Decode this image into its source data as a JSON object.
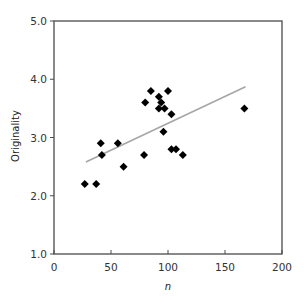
{
  "chart_data": {
    "type": "scatter",
    "title": "",
    "xlabel": "n",
    "ylabel": "Originality",
    "xlim": [
      0,
      200
    ],
    "ylim": [
      1.0,
      5.0
    ],
    "xticks": [
      0,
      50,
      100,
      150,
      200
    ],
    "xtick_labels": [
      "0",
      "50",
      "100",
      "150",
      "200"
    ],
    "yticks": [
      1.0,
      2.0,
      3.0,
      4.0,
      5.0
    ],
    "ytick_labels": [
      "1.0",
      "2.0",
      "3.0",
      "4.0",
      "5.0"
    ],
    "grid": false,
    "legend": null,
    "marker": "diamond",
    "marker_color": "#000000",
    "series": [
      {
        "name": "observations",
        "points": [
          {
            "x": 27,
            "y": 2.2
          },
          {
            "x": 37,
            "y": 2.2
          },
          {
            "x": 41,
            "y": 2.9
          },
          {
            "x": 42,
            "y": 2.7
          },
          {
            "x": 56,
            "y": 2.9
          },
          {
            "x": 61,
            "y": 2.5
          },
          {
            "x": 79,
            "y": 2.7
          },
          {
            "x": 80,
            "y": 3.6
          },
          {
            "x": 85,
            "y": 3.8
          },
          {
            "x": 92,
            "y": 3.7
          },
          {
            "x": 92,
            "y": 3.5
          },
          {
            "x": 94,
            "y": 3.6
          },
          {
            "x": 96,
            "y": 3.1
          },
          {
            "x": 97,
            "y": 3.5
          },
          {
            "x": 100,
            "y": 3.8
          },
          {
            "x": 103,
            "y": 2.8
          },
          {
            "x": 103,
            "y": 3.4
          },
          {
            "x": 107,
            "y": 2.8
          },
          {
            "x": 113,
            "y": 2.7
          },
          {
            "x": 167,
            "y": 3.5
          }
        ]
      }
    ],
    "trendline": {
      "type": "linear",
      "color": "#a6a6a6",
      "x": [
        28,
        168
      ],
      "y": [
        2.58,
        3.87
      ]
    }
  }
}
